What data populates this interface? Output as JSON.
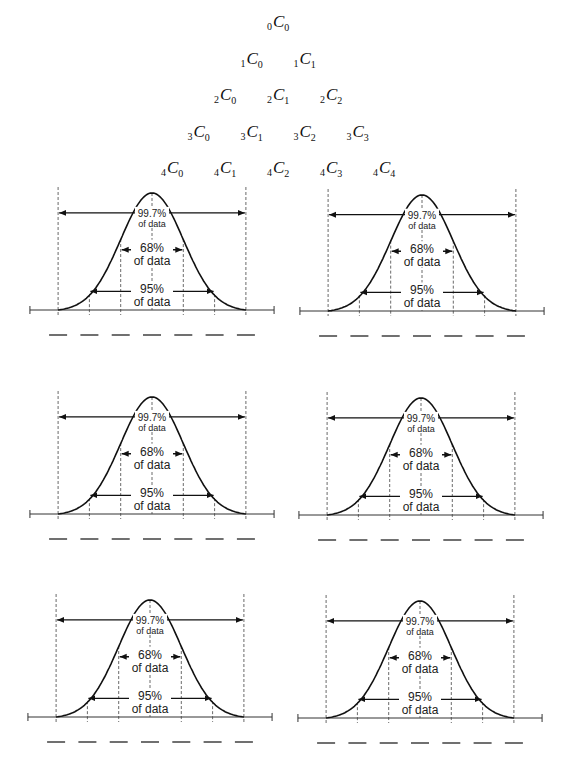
{
  "triangle": {
    "rows": [
      [
        {
          "n": "0",
          "k": "0"
        }
      ],
      [
        {
          "n": "1",
          "k": "0"
        },
        {
          "n": "1",
          "k": "1"
        }
      ],
      [
        {
          "n": "2",
          "k": "0"
        },
        {
          "n": "2",
          "k": "1"
        },
        {
          "n": "2",
          "k": "2"
        }
      ],
      [
        {
          "n": "3",
          "k": "0"
        },
        {
          "n": "3",
          "k": "1"
        },
        {
          "n": "3",
          "k": "2"
        },
        {
          "n": "3",
          "k": "3"
        }
      ],
      [
        {
          "n": "4",
          "k": "0"
        },
        {
          "n": "4",
          "k": "1"
        },
        {
          "n": "4",
          "k": "2"
        },
        {
          "n": "4",
          "k": "3"
        },
        {
          "n": "4",
          "k": "4"
        }
      ]
    ],
    "symbol": "C"
  },
  "curve_labels": {
    "p997": "99.7%",
    "p68": "68%",
    "p95": "95%",
    "of_data": "of data"
  },
  "panels": [
    {
      "cx": 152,
      "axis_y": 310,
      "sigma": 31.3,
      "peak_y": 193
    },
    {
      "cx": 422,
      "axis_y": 311,
      "sigma": 31.3,
      "peak_y": 195
    },
    {
      "cx": 152,
      "axis_y": 514,
      "sigma": 31.3,
      "peak_y": 397
    },
    {
      "cx": 421,
      "axis_y": 515,
      "sigma": 31.3,
      "peak_y": 398
    },
    {
      "cx": 150,
      "axis_y": 717,
      "sigma": 31.3,
      "peak_y": 600
    },
    {
      "cx": 420,
      "axis_y": 718,
      "sigma": 31.3,
      "peak_y": 601
    }
  ],
  "blank_count": 7
}
